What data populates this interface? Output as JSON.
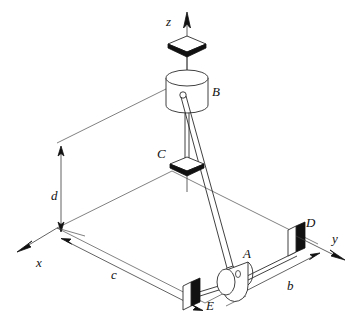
{
  "figure": {
    "type": "engineering-mechanics-free-body-diagram",
    "background_color": "#ffffff",
    "line_color": "#3b3b3b",
    "fill_dark_color": "#111111",
    "fill_light_color": "#ffffff"
  },
  "axes": [
    {
      "id": "z",
      "label": "z",
      "direction": "up",
      "label_x": 166,
      "label_y": 22
    },
    {
      "id": "y",
      "label": "y",
      "direction": "right-down",
      "label_x": 336,
      "label_y": 239
    },
    {
      "id": "x",
      "label": "x",
      "direction": "left-down",
      "label_x": 36,
      "label_y": 263
    }
  ],
  "points": [
    {
      "id": "A",
      "label": "A",
      "label_x": 243,
      "label_y": 254,
      "kind": "hub-collar-on-shaft"
    },
    {
      "id": "B",
      "label": "B",
      "label_x": 214,
      "label_y": 92,
      "kind": "cylinder-ball-joint"
    },
    {
      "id": "C",
      "label": "C",
      "label_x": 158,
      "label_y": 154,
      "kind": "diamond-bearing"
    },
    {
      "id": "D",
      "label": "D",
      "label_x": 307,
      "label_y": 223,
      "kind": "block-bearing"
    },
    {
      "id": "E",
      "label": "E",
      "label_x": 211,
      "label_y": 307,
      "kind": "block-bearing"
    }
  ],
  "dimensions": [
    {
      "id": "d",
      "label": "d",
      "label_x": 51,
      "label_y": 196,
      "orientation": "vertical",
      "arrows": "both"
    },
    {
      "id": "c",
      "label": "c",
      "label_x": 111,
      "label_y": 275,
      "orientation": "diagonal",
      "arrows": "both"
    },
    {
      "id": "b",
      "label": "b",
      "label_x": 291,
      "label_y": 286,
      "orientation": "diagonal",
      "arrows": "both"
    }
  ],
  "elements": {
    "top_bearing": "diamond-bearing-on-z-axis",
    "cylinder_b": "vertical-cylinder-at-B",
    "rod": "two-force-rod-from-B-to-A",
    "shaft": "horizontal-shaft-from-E-through-A-to-D",
    "base_frame": "ground-reference-parallelogram"
  }
}
